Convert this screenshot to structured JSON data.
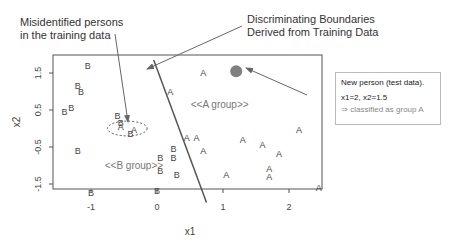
{
  "annotations": {
    "misidentified_line1": "Misidentified persons",
    "misidentified_line2": "in the training data",
    "boundary_line1": "Discriminating Boundaries",
    "boundary_line2": "Derived from Training Data"
  },
  "infobox": {
    "line1": "New person (test data).",
    "line2": "x1=2, x2=1.5",
    "line3": "⇒ classified as group A"
  },
  "colors": {
    "axis": "#555555",
    "points": "#444444",
    "new_point": "#808080",
    "region_label": "#777777",
    "arrow": "#666666"
  },
  "chart_data": {
    "type": "scatter",
    "title": "",
    "xlabel": "x1",
    "ylabel": "x2",
    "xlim": [
      -1.6,
      2.5
    ],
    "ylim": [
      -1.75,
      1.85
    ],
    "x_ticks": [
      -1,
      0,
      1,
      2
    ],
    "y_ticks": [
      1.5,
      0.5,
      -0.5,
      -1.5
    ],
    "grid": false,
    "region_labels": [
      {
        "text": "<<A group>>",
        "x": 0.95,
        "y": 0.55
      },
      {
        "text": "<<B group>>",
        "x": -0.35,
        "y": -1.1
      }
    ],
    "series": [
      {
        "name": "B",
        "points": [
          [
            -1.05,
            1.7
          ],
          [
            -1.2,
            1.15
          ],
          [
            -1.15,
            1.0
          ],
          [
            -1.4,
            0.45
          ],
          [
            -1.3,
            0.55
          ],
          [
            -0.6,
            0.35
          ],
          [
            -0.55,
            0.15
          ],
          [
            -0.4,
            -0.15
          ],
          [
            -1.2,
            -0.6
          ],
          [
            0.05,
            -0.8
          ],
          [
            0.25,
            -0.8
          ],
          [
            0.05,
            -1.15
          ],
          [
            0.3,
            -1.25
          ],
          [
            -1.0,
            -1.75
          ],
          [
            0.0,
            -1.7
          ],
          [
            0.25,
            -0.55
          ]
        ]
      },
      {
        "name": "A",
        "points": [
          [
            0.7,
            1.5
          ],
          [
            0.2,
            1.0
          ],
          [
            -0.55,
            0.05
          ],
          [
            -0.35,
            -0.05
          ],
          [
            0.45,
            -0.25
          ],
          [
            0.7,
            -0.6
          ],
          [
            0.6,
            -0.25
          ],
          [
            1.3,
            -0.3
          ],
          [
            1.6,
            -0.45
          ],
          [
            2.15,
            -0.05
          ],
          [
            1.85,
            -0.7
          ],
          [
            1.7,
            -1.1
          ],
          [
            1.7,
            -1.3
          ],
          [
            1.05,
            -1.25
          ],
          [
            2.45,
            -1.6
          ]
        ]
      },
      {
        "name": "New person (test data)",
        "points": [
          [
            1.2,
            1.55
          ]
        ]
      }
    ],
    "boundary_line": [
      [
        -0.05,
        1.85
      ],
      [
        0.75,
        -2.0
      ]
    ],
    "misidentified_region": {
      "cx": -0.45,
      "cy": 0.0,
      "rx": 0.3,
      "ry": 0.2
    }
  }
}
